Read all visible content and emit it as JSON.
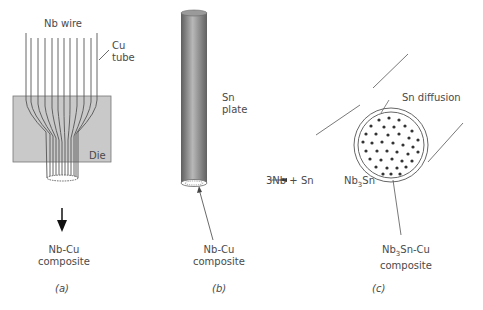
{
  "panel_a": {
    "wire_label": "Nb wire",
    "tube_label_1": "Cu",
    "tube_label_2": "tube",
    "die_label": "Die",
    "product_label_1": "Nb-Cu",
    "product_label_2": "composite",
    "caption": "(a)"
  },
  "panel_b": {
    "plate_label_1": "Sn",
    "plate_label_2": "plate",
    "core_label_1": "Nb-Cu",
    "core_label_2": "composite",
    "caption": "(b)"
  },
  "panel_c": {
    "diffusion_label": "Sn diffusion",
    "reaction_left": "3Nb + Sn",
    "reaction_right": "Nb",
    "reaction_sub": "3",
    "reaction_tail": "Sn",
    "product_label_1a": "Nb",
    "product_sub": "3",
    "product_label_1b": "Sn-Cu",
    "product_label_2": "composite",
    "caption": "(c)"
  },
  "colors": {
    "die_fill": "#c8c8c8",
    "rod_dark": "#6e6e6e",
    "rod_light": "#b4b4b4",
    "line": "#4a4a4a",
    "dot": "#3a3a3a"
  }
}
